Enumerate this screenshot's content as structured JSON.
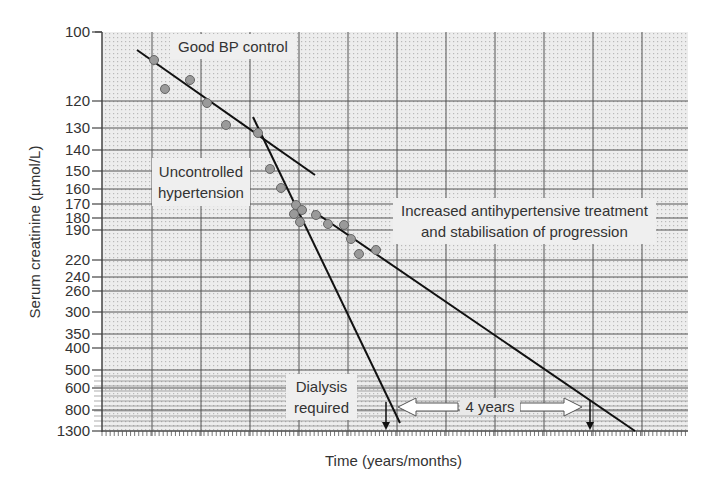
{
  "chart_data": {
    "type": "scatter",
    "title": "",
    "xlabel": "Time (years/months)",
    "ylabel": "Serum creatinine (µmol/L)",
    "y_scale": "reciprocal",
    "y_tick_labels": [
      "100",
      "120",
      "130",
      "140",
      "150",
      "160",
      "170",
      "180",
      "190",
      "220",
      "240",
      "260",
      "300",
      "350",
      "400",
      "500",
      "600",
      "800",
      "1300"
    ],
    "x_tick_labels": [],
    "grid": true,
    "series": [
      {
        "name": "Measurements",
        "type": "scatter",
        "points_px": [
          [
            154,
            60
          ],
          [
            165,
            89
          ],
          [
            190,
            80
          ],
          [
            207,
            103
          ],
          [
            226,
            125
          ],
          [
            258,
            133
          ],
          [
            270,
            169
          ],
          [
            281,
            188
          ],
          [
            296,
            205
          ],
          [
            302,
            210
          ],
          [
            294,
            214
          ],
          [
            300,
            222
          ],
          [
            316,
            215
          ],
          [
            328,
            224
          ],
          [
            344,
            225
          ],
          [
            351,
            239
          ],
          [
            359,
            254
          ],
          [
            376,
            250
          ]
        ]
      },
      {
        "name": "Good BP control trend",
        "type": "line",
        "points_px": [
          [
            137,
            50
          ],
          [
            315,
            175
          ]
        ]
      },
      {
        "name": "Uncontrolled hypertension trend",
        "type": "line",
        "points_px": [
          [
            253,
            117
          ],
          [
            400,
            423
          ]
        ]
      },
      {
        "name": "Increased treatment trend",
        "type": "line",
        "points_px": [
          [
            313,
            211
          ],
          [
            635,
            431
          ]
        ]
      }
    ],
    "annotations": [
      {
        "text": "Good BP control"
      },
      {
        "text": "Uncontrolled hypertension"
      },
      {
        "text": "Increased antihypertensive treatment and stabilisation of progression"
      },
      {
        "text": "Dialysis required"
      },
      {
        "text": "4 years"
      }
    ]
  },
  "labels": {
    "ylabel": "Serum creatinine (µmol/L)",
    "xlabel": "Time (years/months)",
    "good_bp": "Good BP control",
    "uncontrolled_1": "Uncontrolled",
    "uncontrolled_2": "hypertension",
    "increased_1": "Increased antihypertensive treatment",
    "increased_2": "and stabilisation of progression",
    "dialysis_1": "Dialysis",
    "dialysis_2": "required",
    "four_years": "4 years"
  },
  "yticks": [
    {
      "label": "100",
      "y": 32
    },
    {
      "label": "120",
      "y": 101
    },
    {
      "label": "130",
      "y": 128
    },
    {
      "label": "140",
      "y": 150
    },
    {
      "label": "150",
      "y": 171
    },
    {
      "label": "160",
      "y": 189
    },
    {
      "label": "170",
      "y": 204
    },
    {
      "label": "180",
      "y": 218
    },
    {
      "label": "190",
      "y": 230
    },
    {
      "label": "220",
      "y": 260
    },
    {
      "label": "240",
      "y": 277
    },
    {
      "label": "260",
      "y": 291
    },
    {
      "label": "300",
      "y": 312
    },
    {
      "label": "350",
      "y": 334
    },
    {
      "label": "400",
      "y": 348
    },
    {
      "label": "500",
      "y": 370
    },
    {
      "label": "600",
      "y": 388
    },
    {
      "label": "800",
      "y": 410
    },
    {
      "label": "1300",
      "y": 431
    }
  ],
  "colors": {
    "grid_bg": "#e9e9e9",
    "grid_line": "#555555",
    "dot_fill": "#9a9a9a",
    "dot_stroke": "#666666",
    "trend": "#111111",
    "box_bg": "#efefef"
  }
}
